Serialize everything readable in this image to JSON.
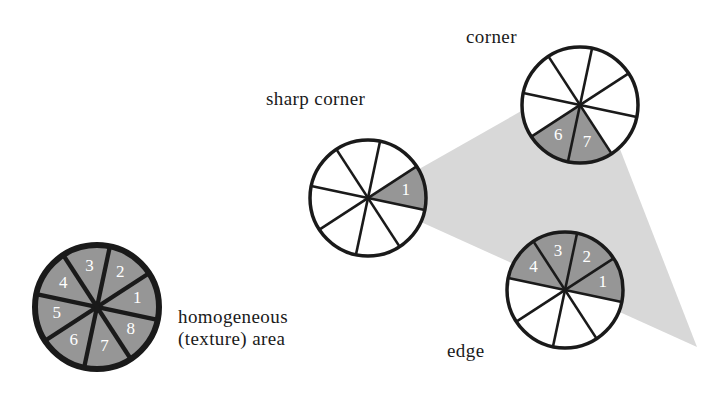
{
  "figure": {
    "background_color": "#ffffff",
    "colors": {
      "sector_gray": "#969696",
      "sector_white": "#ffffff",
      "wedge_light_gray": "#d8d8d8",
      "outline": "#1a1a1a",
      "number_text": "#ffffff",
      "label_text": "#1a1a1a"
    },
    "wedge": {
      "name": "light-gray-region",
      "points": "368,198 590,72 697,347"
    },
    "circles": [
      {
        "id": "homogeneous",
        "label": "homogeneous\n(texture) area",
        "label_lines": [
          "homogeneous",
          "(texture) area"
        ],
        "cx": 97,
        "cy": 307,
        "r": 62,
        "stroke_width": 6,
        "rotation_deg": -12,
        "sectors": [
          {
            "num": "1",
            "filled": true
          },
          {
            "num": "2",
            "filled": true
          },
          {
            "num": "3",
            "filled": true
          },
          {
            "num": "4",
            "filled": true
          },
          {
            "num": "5",
            "filled": true
          },
          {
            "num": "6",
            "filled": true
          },
          {
            "num": "7",
            "filled": true
          },
          {
            "num": "8",
            "filled": true
          }
        ]
      },
      {
        "id": "sharp-corner",
        "label": "sharp corner",
        "label_lines": [
          "sharp corner"
        ],
        "cx": 368,
        "cy": 198,
        "r": 58,
        "stroke_width": 3.5,
        "rotation_deg": -12,
        "sectors": [
          {
            "num": "1",
            "filled": true
          },
          {
            "num": "",
            "filled": false
          },
          {
            "num": "",
            "filled": false
          },
          {
            "num": "",
            "filled": false
          },
          {
            "num": "",
            "filled": false
          },
          {
            "num": "",
            "filled": false
          },
          {
            "num": "",
            "filled": false
          },
          {
            "num": "",
            "filled": false
          }
        ]
      },
      {
        "id": "corner",
        "label": "corner",
        "label_lines": [
          "corner"
        ],
        "cx": 580,
        "cy": 105,
        "r": 58,
        "stroke_width": 3.5,
        "rotation_deg": -12,
        "sectors": [
          {
            "num": "",
            "filled": false
          },
          {
            "num": "",
            "filled": false
          },
          {
            "num": "",
            "filled": false
          },
          {
            "num": "",
            "filled": false
          },
          {
            "num": "",
            "filled": false
          },
          {
            "num": "6",
            "filled": true
          },
          {
            "num": "7",
            "filled": true
          },
          {
            "num": "",
            "filled": false
          }
        ]
      },
      {
        "id": "edge",
        "label": "edge",
        "label_lines": [
          "edge"
        ],
        "cx": 565,
        "cy": 290,
        "r": 58,
        "stroke_width": 3.5,
        "rotation_deg": -12,
        "sectors": [
          {
            "num": "1",
            "filled": true
          },
          {
            "num": "2",
            "filled": true
          },
          {
            "num": "3",
            "filled": true
          },
          {
            "num": "4",
            "filled": true
          },
          {
            "num": "",
            "filled": false
          },
          {
            "num": "",
            "filled": false
          },
          {
            "num": "",
            "filled": false
          },
          {
            "num": "",
            "filled": false
          }
        ]
      }
    ]
  }
}
